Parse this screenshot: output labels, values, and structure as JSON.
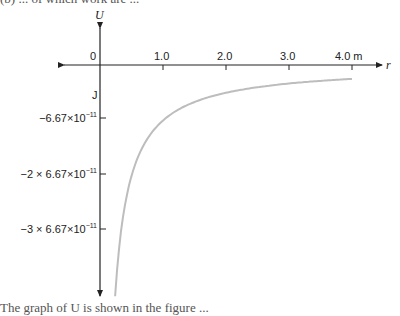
{
  "page": {
    "top_clipped_text": "(b) ... of which work are ...",
    "bottom_clipped_text": "The graph of U is shown in the figure ..."
  },
  "chart_data": {
    "type": "line",
    "title": "",
    "xlabel": "r",
    "ylabel": "U",
    "x_unit": "m",
    "y_unit": "J",
    "origin_label": "0",
    "x_ticks": [
      {
        "value": 1.0,
        "label": "1.0"
      },
      {
        "value": 2.0,
        "label": "2.0"
      },
      {
        "value": 3.0,
        "label": "3.0"
      },
      {
        "value": 4.0,
        "label": "4.0 m"
      }
    ],
    "y_ticks": [
      {
        "value": -6.67e-11,
        "label_prefix": "",
        "label_main": "−6.67×10",
        "label_exp": "−11"
      },
      {
        "value": -1.334e-10,
        "label_prefix": "−2 × ",
        "label_main": "6.67×10",
        "label_exp": "−11"
      },
      {
        "value": -2.001e-10,
        "label_prefix": "−3 × ",
        "label_main": "6.67×10",
        "label_exp": "−11"
      }
    ],
    "y_tick_labels": [
      "−6.67×10⁻¹¹",
      "−2 × 6.67×10⁻¹¹",
      "−3 × 6.67×10⁻¹¹"
    ],
    "function": "U = -6.67e-11 / r",
    "x": [
      0.24,
      0.3,
      0.4,
      0.5,
      0.6,
      0.75,
      1.0,
      1.25,
      1.5,
      2.0,
      2.5,
      3.0,
      3.5,
      4.0
    ],
    "series": [
      {
        "name": "U(r)",
        "color": "#bdbdbd",
        "values": [
          -2.779e-10,
          -2.223e-10,
          -1.668e-10,
          -1.334e-10,
          -1.112e-10,
          -8.89e-11,
          -6.67e-11,
          -5.34e-11,
          -4.45e-11,
          -3.34e-11,
          -2.67e-11,
          -2.22e-11,
          -1.91e-11,
          -1.67e-11
        ]
      }
    ],
    "xlim": [
      -0.6,
      4.4
    ],
    "ylim": [
      -2.9e-10,
      7e-11
    ],
    "grid": false,
    "legend": "none",
    "colors": {
      "axis": "#222222",
      "curve": "#bdbdbd"
    }
  }
}
